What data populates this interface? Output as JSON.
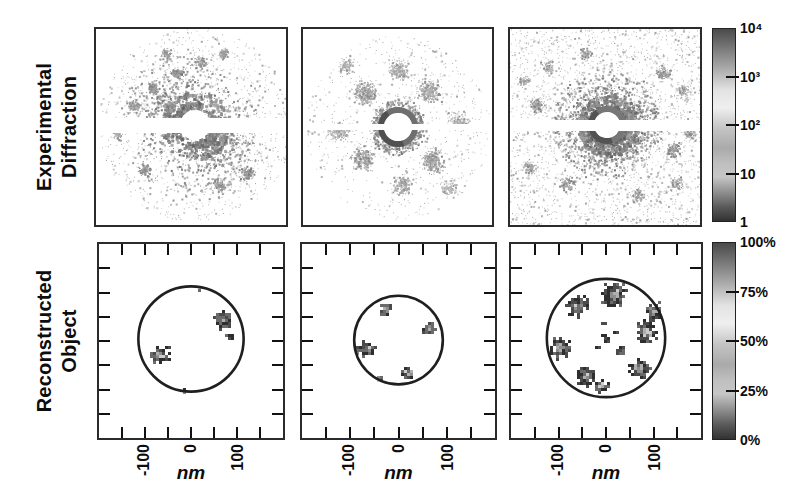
{
  "figure": {
    "background": "#ffffff",
    "frame_color": "#2b2b2b",
    "row_labels": [
      {
        "lines": [
          "Experimental",
          "Diffraction"
        ]
      },
      {
        "lines": [
          "Reconstructed",
          "Object"
        ]
      }
    ],
    "x_axis": {
      "tick_labels": [
        "-100",
        "0",
        "100"
      ],
      "tick_values_nm": [
        -100,
        0,
        100
      ],
      "minor_tick_step_nm": 50,
      "range_nm": [
        -200,
        200
      ],
      "unit": "nm"
    },
    "colorbars": [
      {
        "name": "diffraction-intensity",
        "scale": "log",
        "tick_labels": [
          "10⁴",
          "10³",
          "10²",
          "10",
          "1"
        ],
        "tick_values": [
          10000,
          1000,
          100,
          10,
          1
        ]
      },
      {
        "name": "object-density",
        "scale": "linear",
        "tick_labels": [
          "100%",
          "75%",
          "50%",
          "25%",
          "0%"
        ],
        "tick_values": [
          100,
          75,
          50,
          25,
          0
        ]
      }
    ],
    "colormap_grays": [
      {
        "t": 0.0,
        "c": "#4a4a4a"
      },
      {
        "t": 0.08,
        "c": "#6f6f6f"
      },
      {
        "t": 0.2,
        "c": "#a8a8a8"
      },
      {
        "t": 0.32,
        "c": "#e3e3e3"
      },
      {
        "t": 0.41,
        "c": "#efefef"
      },
      {
        "t": 0.52,
        "c": "#c3c3c3"
      },
      {
        "t": 0.62,
        "c": "#aaaaaa"
      },
      {
        "t": 0.7,
        "c": "#bfbfbf"
      },
      {
        "t": 0.77,
        "c": "#c6c6c6"
      },
      {
        "t": 0.85,
        "c": "#8f8f8f"
      },
      {
        "t": 0.93,
        "c": "#585858"
      },
      {
        "t": 1.0,
        "c": "#323232"
      }
    ],
    "pixel_palette": [
      "#2e2e2e",
      "#4b4b4b",
      "#6b6b6b",
      "#8d8d8d",
      "#afafaf",
      "#cccccc"
    ],
    "circle_color": "#1f1f1f"
  },
  "chart_data": [
    {
      "id": "diffraction-1",
      "type": "heatmap",
      "row": "experimental-diffraction",
      "intensity_scale": "log 1..10^4",
      "seed": 11,
      "center": [
        99,
        96
      ],
      "background_speckle": {
        "count": 1100,
        "rmax": 97,
        "uniform": false
      },
      "anisotropy": {
        "angle_deg": 38,
        "base": 0.28
      },
      "rings": [
        {
          "r": 20,
          "w": 5,
          "count": 950,
          "g": [
            95,
            165
          ],
          "smax": 3
        },
        {
          "r": 31,
          "w": 6,
          "count": 820,
          "g": [
            105,
            175
          ],
          "smax": 3
        },
        {
          "r": 44,
          "w": 7,
          "count": 640,
          "g": [
            115,
            185
          ],
          "smax": 2
        },
        {
          "r": 57,
          "w": 8,
          "count": 430,
          "g": [
            125,
            192
          ],
          "smax": 2
        },
        {
          "r": 71,
          "w": 8,
          "count": 270,
          "g": [
            138,
            200
          ],
          "smax": 2
        }
      ],
      "clusters": [
        {
          "x": -18,
          "y": -52,
          "sigma": 5,
          "count": 120,
          "g": [
            115,
            175
          ]
        },
        {
          "x": -42,
          "y": -38,
          "sigma": 5,
          "count": 100,
          "g": [
            120,
            180
          ]
        },
        {
          "x": 5,
          "y": -64,
          "sigma": 5,
          "count": 90,
          "g": [
            125,
            185
          ]
        },
        {
          "x": -62,
          "y": -20,
          "sigma": 5,
          "count": 90,
          "g": [
            125,
            185
          ]
        },
        {
          "x": 28,
          "y": -72,
          "sigma": 5,
          "count": 70,
          "g": [
            135,
            190
          ]
        },
        {
          "x": -78,
          "y": 8,
          "sigma": 5,
          "count": 70,
          "g": [
            135,
            190
          ]
        },
        {
          "x": -30,
          "y": -72,
          "sigma": 5,
          "count": 70,
          "g": [
            130,
            190
          ]
        },
        {
          "x": 52,
          "y": 48,
          "sigma": 6,
          "count": 110,
          "g": [
            120,
            180
          ]
        },
        {
          "x": 24,
          "y": 60,
          "sigma": 6,
          "count": 90,
          "g": [
            125,
            185
          ]
        },
        {
          "x": -52,
          "y": 44,
          "sigma": 6,
          "count": 90,
          "g": [
            125,
            185
          ]
        }
      ],
      "missing_band": {
        "y": 89,
        "h": 15
      },
      "beamstop": {
        "r": 15
      },
      "beamstop_ring": null
    },
    {
      "id": "diffraction-2",
      "type": "heatmap",
      "row": "experimental-diffraction",
      "intensity_scale": "log 1..10^4",
      "seed": 22,
      "center": [
        95,
        98
      ],
      "background_speckle": {
        "count": 700,
        "rmax": 92,
        "uniform": false
      },
      "anisotropy": null,
      "rings": [
        {
          "r": 23,
          "w": 6,
          "count": 520,
          "g": [
            115,
            180
          ],
          "smax": 2
        }
      ],
      "clusters": [
        {
          "x": -32,
          "y": -34,
          "sigma": 10,
          "count": 260,
          "g": [
            130,
            190
          ]
        },
        {
          "x": 30,
          "y": -36,
          "sigma": 10,
          "count": 240,
          "g": [
            135,
            190
          ]
        },
        {
          "x": -36,
          "y": 30,
          "sigma": 10,
          "count": 240,
          "g": [
            130,
            190
          ]
        },
        {
          "x": 34,
          "y": 34,
          "sigma": 10,
          "count": 240,
          "g": [
            135,
            190
          ]
        },
        {
          "x": 0,
          "y": -58,
          "sigma": 9,
          "count": 160,
          "g": [
            140,
            195
          ]
        },
        {
          "x": 4,
          "y": 58,
          "sigma": 9,
          "count": 160,
          "g": [
            140,
            195
          ]
        },
        {
          "x": -60,
          "y": 4,
          "sigma": 9,
          "count": 130,
          "g": [
            145,
            200
          ]
        },
        {
          "x": 60,
          "y": -6,
          "sigma": 9,
          "count": 130,
          "g": [
            145,
            200
          ]
        },
        {
          "x": -52,
          "y": -62,
          "sigma": 8,
          "count": 90,
          "g": [
            150,
            200
          ]
        },
        {
          "x": 50,
          "y": 60,
          "sigma": 8,
          "count": 90,
          "g": [
            150,
            200
          ]
        }
      ],
      "missing_band": {
        "y": 95,
        "h": 6
      },
      "beamstop": {
        "r": 14
      },
      "beamstop_ring": {
        "r": 17,
        "w": 6,
        "color": "#6f6f6f"
      }
    },
    {
      "id": "diffraction-3",
      "type": "heatmap",
      "row": "experimental-diffraction",
      "intensity_scale": "log 1..10^4",
      "seed": 33,
      "center": [
        97,
        96
      ],
      "background_speckle": {
        "count": 2400,
        "rmax": 0,
        "uniform": true
      },
      "anisotropy": {
        "angle_deg": 0,
        "base": 0.55
      },
      "rings": [
        {
          "r": 18,
          "w": 5,
          "count": 900,
          "g": [
            90,
            160
          ],
          "smax": 3
        },
        {
          "r": 27,
          "w": 5,
          "count": 820,
          "g": [
            100,
            170
          ],
          "smax": 3
        },
        {
          "r": 37,
          "w": 6,
          "count": 660,
          "g": [
            110,
            180
          ],
          "smax": 2
        },
        {
          "r": 49,
          "w": 7,
          "count": 490,
          "g": [
            120,
            188
          ],
          "smax": 2
        }
      ],
      "clusters": [
        {
          "x": -70,
          "y": -20,
          "sigma": 7,
          "count": 110,
          "g": [
            120,
            185
          ]
        },
        {
          "x": 65,
          "y": 25,
          "sigma": 7,
          "count": 110,
          "g": [
            120,
            185
          ]
        },
        {
          "x": -40,
          "y": 58,
          "sigma": 7,
          "count": 100,
          "g": [
            125,
            185
          ]
        },
        {
          "x": 55,
          "y": -52,
          "sigma": 7,
          "count": 100,
          "g": [
            125,
            185
          ]
        },
        {
          "x": -78,
          "y": 42,
          "sigma": 6,
          "count": 80,
          "g": [
            130,
            190
          ]
        },
        {
          "x": 82,
          "y": 8,
          "sigma": 6,
          "count": 80,
          "g": [
            130,
            190
          ]
        },
        {
          "x": -22,
          "y": -72,
          "sigma": 6,
          "count": 80,
          "g": [
            130,
            190
          ]
        },
        {
          "x": 30,
          "y": 70,
          "sigma": 6,
          "count": 80,
          "g": [
            130,
            190
          ]
        },
        {
          "x": 76,
          "y": -34,
          "sigma": 6,
          "count": 70,
          "g": [
            135,
            190
          ]
        },
        {
          "x": -60,
          "y": -58,
          "sigma": 6,
          "count": 70,
          "g": [
            135,
            190
          ]
        },
        {
          "x": 70,
          "y": 58,
          "sigma": 6,
          "count": 70,
          "g": [
            135,
            190
          ]
        },
        {
          "x": -84,
          "y": -44,
          "sigma": 5,
          "count": 60,
          "g": [
            140,
            195
          ]
        }
      ],
      "missing_band": {
        "y": 91,
        "h": 11
      },
      "beamstop": {
        "r": 13
      },
      "beamstop_ring": {
        "r": 16,
        "w": 6,
        "color": "#777777"
      }
    },
    {
      "id": "object-1",
      "type": "heatmap",
      "row": "reconstructed-object",
      "units": "nm",
      "density_scale": "0-100%",
      "seed": 4,
      "support_radius_nm": 112,
      "center_offset_px": [
        0,
        -2
      ],
      "blobs_nm": [
        {
          "x": 66,
          "y": 44,
          "r": 26
        },
        {
          "x": -70,
          "y": -30,
          "r": 28
        },
        {
          "x": 82,
          "y": 4,
          "r": 9
        },
        {
          "x": -16,
          "y": -108,
          "r": 7
        },
        {
          "x": 17,
          "y": 112,
          "r": 6
        }
      ]
    },
    {
      "id": "object-2",
      "type": "heatmap",
      "row": "reconstructed-object",
      "units": "nm",
      "density_scale": "0-100%",
      "seed": 5,
      "support_radius_nm": 90,
      "center_offset_px": [
        0,
        -1
      ],
      "blobs_nm": [
        {
          "x": -29,
          "y": 64,
          "r": 18
        },
        {
          "x": 60,
          "y": 27,
          "r": 17
        },
        {
          "x": -64,
          "y": -16,
          "r": 19
        },
        {
          "x": 17,
          "y": -64,
          "r": 17
        },
        {
          "x": -42,
          "y": -76,
          "r": 9
        },
        {
          "x": -83,
          "y": -20,
          "r": 7
        }
      ]
    },
    {
      "id": "object-3",
      "type": "heatmap",
      "row": "reconstructed-object",
      "units": "nm",
      "density_scale": "0-100%",
      "seed": 6,
      "support_radius_nm": 122,
      "center_offset_px": [
        0,
        -3
      ],
      "blobs_nm": [
        {
          "x": 13,
          "y": 92,
          "r": 32
        },
        {
          "x": -60,
          "y": 68,
          "r": 28
        },
        {
          "x": 96,
          "y": 56,
          "r": 22
        },
        {
          "x": 80,
          "y": 16,
          "r": 30
        },
        {
          "x": -98,
          "y": -16,
          "r": 26
        },
        {
          "x": -44,
          "y": -76,
          "r": 28
        },
        {
          "x": -12,
          "y": -94,
          "r": 20
        },
        {
          "x": 66,
          "y": -60,
          "r": 28
        },
        {
          "x": -2,
          "y": 2,
          "r": 12,
          "dark": true
        },
        {
          "x": 26,
          "y": -22,
          "r": 11,
          "dark": true
        },
        {
          "x": -8,
          "y": 32,
          "r": 5,
          "dark": true
        },
        {
          "x": -20,
          "y": -16,
          "r": 4,
          "dark": true
        },
        {
          "x": 16,
          "y": 14,
          "r": 4,
          "dark": true
        }
      ]
    }
  ]
}
